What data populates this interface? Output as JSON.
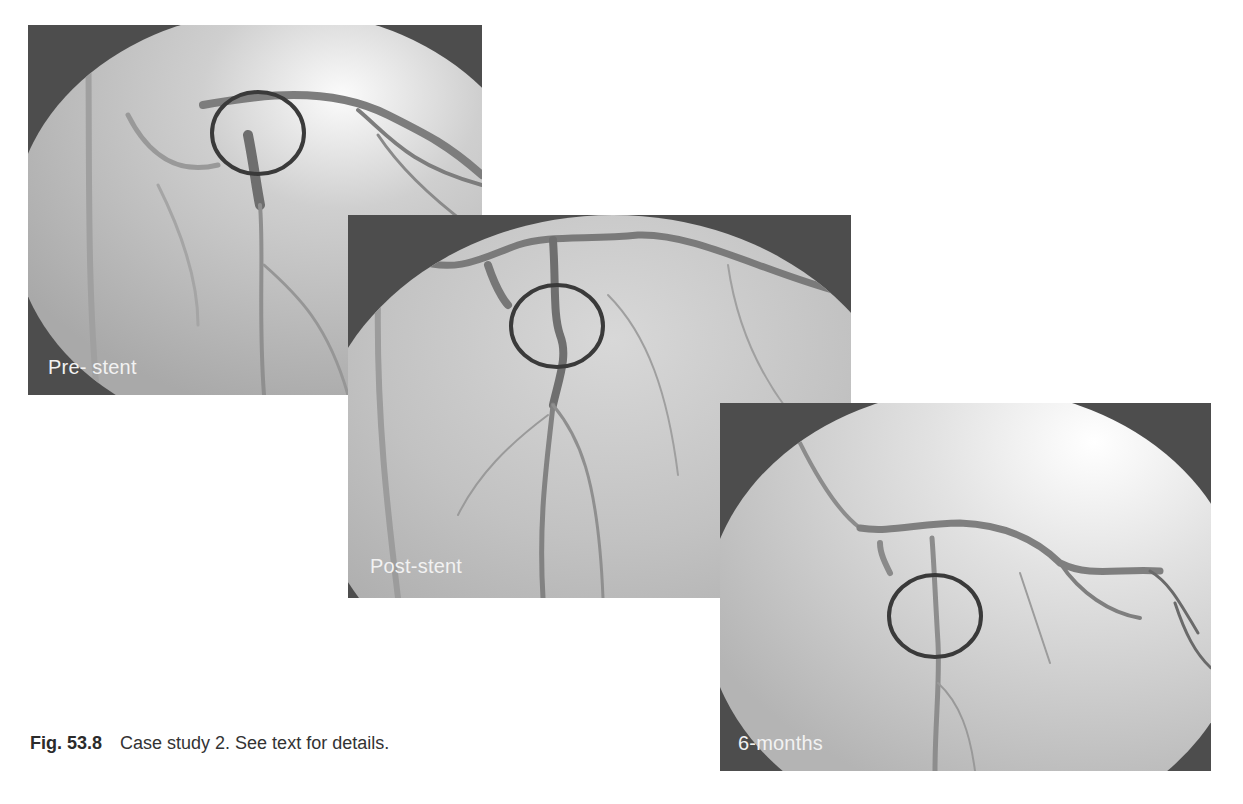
{
  "figure": {
    "number": "Fig. 53.8",
    "caption": "Case study 2. See text for details.",
    "panels": [
      {
        "id": "pre-stent",
        "label": "Pre- stent"
      },
      {
        "id": "post-stent",
        "label": "Post-stent"
      },
      {
        "id": "six-months",
        "label": "6-months"
      }
    ]
  },
  "colors": {
    "frame": "#4d4d4d",
    "marker_ring": "#3a3a3a",
    "label_text": "#f2f2f2",
    "caption_text": "#333333"
  }
}
